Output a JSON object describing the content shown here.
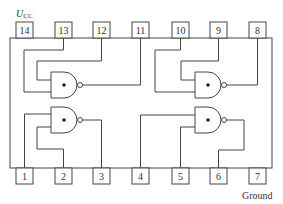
{
  "diagram": {
    "supply_label": "U",
    "supply_sub": "CC",
    "ground_label": "Ground",
    "top_pins": [
      "14",
      "13",
      "12",
      "11",
      "10",
      "9",
      "8"
    ],
    "bottom_pins": [
      "1",
      "2",
      "3",
      "4",
      "5",
      "6",
      "7"
    ]
  }
}
